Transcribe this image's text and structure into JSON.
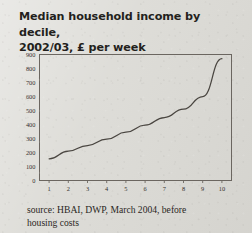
{
  "title": {
    "line1": "Median household income by decile,",
    "line2": "2002/03, £ per week"
  },
  "source": {
    "line1": "source: HBAI, DWP, March 2004, before",
    "line2": "housing costs"
  },
  "colors": {
    "paper": "#dcdbd6",
    "ink": "#231f1c",
    "axis": "#5d5852",
    "line": "#4a4641"
  },
  "chart_data": {
    "type": "line",
    "title": "Median household income by decile, 2002/03, £ per week",
    "xlabel": "",
    "ylabel": "",
    "categories": [
      "1",
      "2",
      "3",
      "4",
      "5",
      "6",
      "7",
      "8",
      "9",
      "10"
    ],
    "x": [
      1,
      2,
      3,
      4,
      5,
      6,
      7,
      8,
      9,
      10
    ],
    "values": [
      155,
      210,
      250,
      295,
      345,
      395,
      450,
      510,
      600,
      870
    ],
    "series": [
      {
        "name": "Median household income",
        "values": [
          155,
          210,
          250,
          295,
          345,
          395,
          450,
          510,
          600,
          870
        ]
      }
    ],
    "ylim": [
      0,
      900
    ],
    "yticks": [
      0,
      100,
      200,
      300,
      400,
      500,
      600,
      700,
      800,
      900
    ],
    "ytick_labels": [
      "0",
      "100",
      "200",
      "300",
      "400",
      "500",
      "600",
      "700",
      "800",
      "900"
    ],
    "xtick_labels": [
      "1",
      "2",
      "3",
      "4",
      "5",
      "6",
      "7",
      "8",
      "9",
      "10"
    ],
    "grid": false,
    "legend": false
  }
}
